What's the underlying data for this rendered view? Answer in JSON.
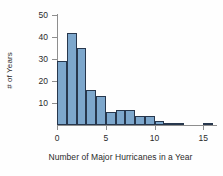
{
  "chart_data": {
    "type": "bar",
    "title": "",
    "xlabel": "Number of Major Hurricanes in a Year",
    "ylabel": "# of Years",
    "xlim": [
      0,
      16
    ],
    "ylim": [
      0,
      50
    ],
    "xticks": [
      0,
      5,
      10,
      15
    ],
    "yticks": [
      10,
      20,
      30,
      40,
      50
    ],
    "grid": false,
    "legend": null,
    "bin_width": 1,
    "bin_starts": [
      0,
      1,
      2,
      3,
      4,
      5,
      6,
      7,
      8,
      9,
      10,
      11,
      12,
      15
    ],
    "categories": [
      "0",
      "1",
      "2",
      "3",
      "4",
      "5",
      "6",
      "7",
      "8",
      "9",
      "10",
      "11",
      "12",
      "15"
    ],
    "values": [
      29,
      42,
      35,
      16,
      13,
      6,
      7,
      7,
      4,
      4,
      2,
      1,
      1,
      1
    ],
    "bar_fill_color": "#7da7cc",
    "bar_edge_color": "#27374d",
    "axis_color": "#8e8e8e",
    "text_color": "#2b2b2b",
    "background_color": "#fefefe"
  },
  "axes": {
    "ylabel_text": "# of Years",
    "xlabel_text": "Number of Major Hurricanes in a Year",
    "ytick_labels": [
      "10",
      "20",
      "30",
      "40",
      "50"
    ],
    "xtick_labels": [
      "0",
      "5",
      "10",
      "15"
    ]
  }
}
